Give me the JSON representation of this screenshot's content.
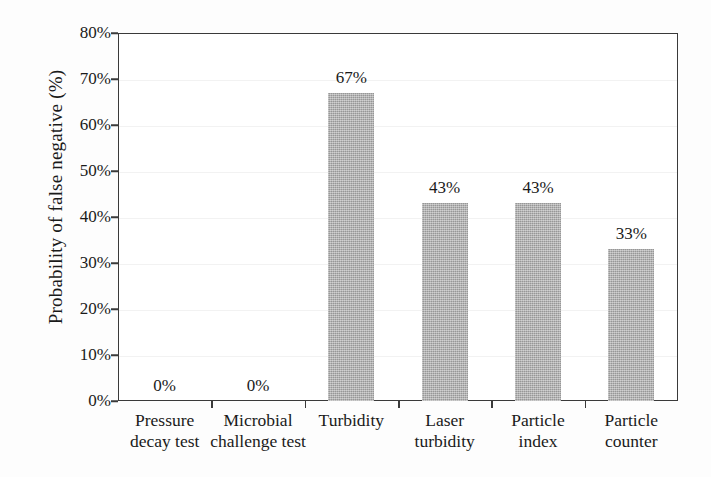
{
  "chart_data": {
    "type": "bar",
    "title": "",
    "xlabel": "",
    "ylabel": "Probability of false negative (%)",
    "categories": [
      "Pressure decay test",
      "Microbial challenge test",
      "Turbidity",
      "Laser turbidity",
      "Particle index",
      "Particle counter"
    ],
    "category_lines": [
      [
        "Pressure",
        "decay test"
      ],
      [
        "Microbial",
        "challenge test"
      ],
      [
        "Turbidity",
        ""
      ],
      [
        "Laser",
        "turbidity"
      ],
      [
        "Particle",
        "index"
      ],
      [
        "Particle",
        "counter"
      ]
    ],
    "values": [
      0,
      0,
      67,
      43,
      43,
      33
    ],
    "value_labels": [
      "0%",
      "0%",
      "67%",
      "43%",
      "43%",
      "33%"
    ],
    "ylim": [
      0,
      80
    ],
    "ytick_values": [
      0,
      10,
      20,
      30,
      40,
      50,
      60,
      70,
      80
    ],
    "ytick_labels": [
      "0%",
      "10%",
      "20%",
      "30%",
      "40%",
      "50%",
      "60%",
      "70%",
      "80%"
    ],
    "grid": true,
    "legend": null,
    "bar_color": "#a9a9a9",
    "axis_color": "#3a3a3a",
    "gridline_color": "#f2f2f2",
    "text_color": "#1a1a1a"
  }
}
